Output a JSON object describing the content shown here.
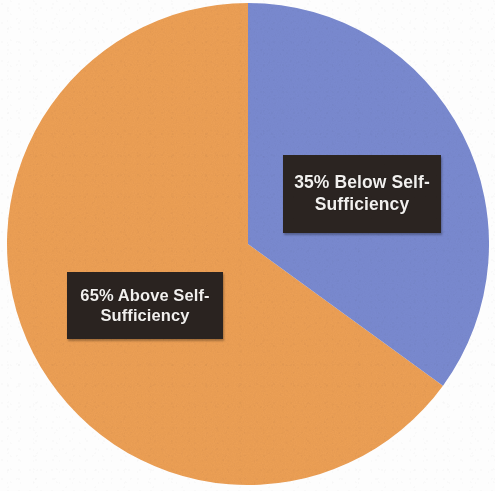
{
  "figure": {
    "name": "self-sufficiency-pie-chart",
    "background_color": "#fdfdfd",
    "width": 495,
    "height": 491
  },
  "chart_data": {
    "type": "pie",
    "title": "",
    "subtitle": "",
    "xlabel": "",
    "ylabel": "",
    "grid": false,
    "legend_position": "none",
    "units": "percent",
    "total": 100,
    "start_angle_deg": 0,
    "direction": "clockwise",
    "categories": [
      "Below Self-Sufficiency",
      "Above Self-Sufficiency"
    ],
    "values": [
      35,
      65
    ],
    "colors": [
      "#7a8ad0",
      "#eda055"
    ],
    "slices": [
      {
        "label": "Below Self-Sufficiency",
        "value": 35,
        "display_value": "35%",
        "data_label": "35% Below Self-Sufficiency",
        "color": "#7a8ad0",
        "start_angle_deg": 0,
        "end_angle_deg": 126
      },
      {
        "label": "Above Self-Sufficiency",
        "value": 65,
        "display_value": "65%",
        "data_label": "65% Above Self-Sufficiency",
        "color": "#eda055",
        "start_angle_deg": 126,
        "end_angle_deg": 360
      }
    ]
  },
  "labels": {
    "below": {
      "line1": "35% Below Self-",
      "line2": "Sufficiency",
      "full": "35% Below Self-Sufficiency",
      "box_color": "#2b2421",
      "text_color": "#f2f0ee"
    },
    "above": {
      "line1": "65% Above Self-",
      "line2": "Sufficiency",
      "full": "65% Above Self-Sufficiency",
      "box_color": "#2a2320",
      "text_color": "#f2f0ee"
    }
  }
}
